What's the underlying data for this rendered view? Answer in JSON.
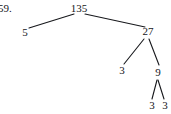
{
  "page": {
    "width": 171,
    "height": 114,
    "background_color": "#ffffff",
    "line_color": "#17181c",
    "text_color": "#141519"
  },
  "problem": {
    "number_label": "59."
  },
  "chart_data": {
    "type": "diagram",
    "diagram_kind": "factor-tree",
    "title": "",
    "root_value": 135,
    "factorization": "135 = 5 × 3 × 3 × 3",
    "nodes": [
      {
        "id": "n135",
        "label": "135",
        "x": 79,
        "y": 8,
        "level": 0
      },
      {
        "id": "n5",
        "label": "5",
        "x": 25,
        "y": 32,
        "level": 1
      },
      {
        "id": "n27",
        "label": "27",
        "x": 148,
        "y": 31,
        "level": 1
      },
      {
        "id": "n3a",
        "label": "3",
        "x": 122,
        "y": 70,
        "level": 2
      },
      {
        "id": "n9",
        "label": "9",
        "x": 158,
        "y": 72,
        "level": 2
      },
      {
        "id": "n3b",
        "label": "3",
        "x": 152,
        "y": 105,
        "level": 3
      },
      {
        "id": "n3c",
        "label": "3",
        "x": 165,
        "y": 105,
        "level": 3
      }
    ],
    "edges": [
      {
        "from": "n135",
        "to": "n5",
        "x1": 74,
        "y1": 14,
        "x2": 29,
        "y2": 28
      },
      {
        "from": "n135",
        "to": "n27",
        "x1": 85,
        "y1": 14,
        "x2": 145,
        "y2": 27
      },
      {
        "from": "n27",
        "to": "n3a",
        "x1": 144,
        "y1": 39,
        "x2": 124,
        "y2": 64
      },
      {
        "from": "n27",
        "to": "n9",
        "x1": 149,
        "y1": 39,
        "x2": 159,
        "y2": 65
      },
      {
        "from": "n9",
        "to": "n3b",
        "x1": 157,
        "y1": 80,
        "x2": 152,
        "y2": 99
      },
      {
        "from": "n9",
        "to": "n3c",
        "x1": 158,
        "y1": 80,
        "x2": 164,
        "y2": 99
      }
    ]
  }
}
